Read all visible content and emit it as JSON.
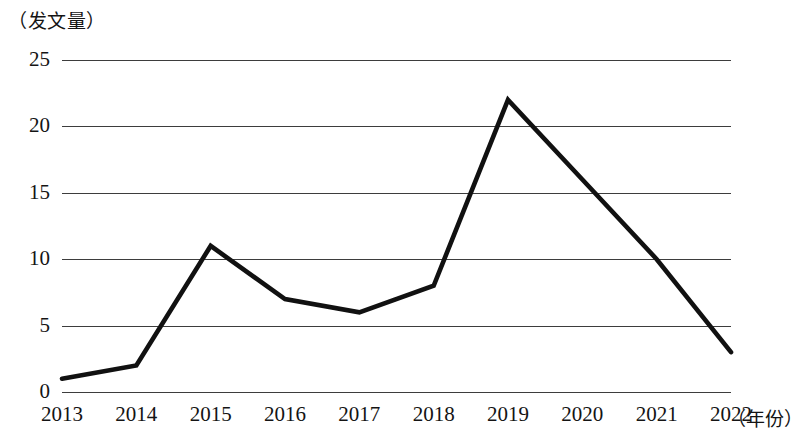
{
  "chart_data": {
    "type": "line",
    "title": "",
    "subtitle": "",
    "xlabel": "（年份）",
    "ylabel": "（发文量）",
    "categories": [
      "2013",
      "2014",
      "2015",
      "2016",
      "2017",
      "2018",
      "2019",
      "2020",
      "2021",
      "2022"
    ],
    "x": [
      2013,
      2014,
      2015,
      2016,
      2017,
      2018,
      2019,
      2020,
      2021,
      2022
    ],
    "values": [
      1,
      2,
      11,
      7,
      6,
      8,
      22,
      16,
      10,
      3
    ],
    "series": [
      {
        "name": "发文量",
        "values": [
          1,
          2,
          11,
          7,
          6,
          8,
          22,
          16,
          10,
          3
        ]
      }
    ],
    "ylim": [
      0,
      25
    ],
    "ytick_labels": [
      "0",
      "5",
      "10",
      "15",
      "20",
      "25"
    ],
    "yticks": [
      0,
      5,
      10,
      15,
      20,
      25
    ],
    "grid": "horizontal",
    "legend": "none",
    "line_color": "#111111",
    "grid_color": "#3d3d3d",
    "background_color": "#ffffff",
    "markers": "none"
  }
}
